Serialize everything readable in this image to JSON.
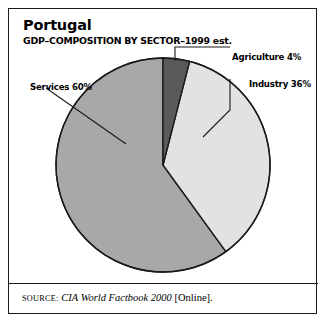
{
  "header": {
    "title": "Portugal",
    "subtitle": "GDP–COMPOSITION BY SECTOR–1999 est."
  },
  "labels": {
    "agriculture": "Agriculture 4%",
    "industry": "Industry 36%",
    "services": "Services 60%"
  },
  "source": {
    "kicker": "SOURCE:",
    "work": "CIA World Factbook 2000",
    "suffix": "[Online]."
  },
  "colors": {
    "agriculture": "#5a5a5a",
    "industry": "#e2e2e2",
    "services": "#a8a8a8",
    "outline": "#1a1a1a",
    "background": "#ffffff",
    "leader": "#1a1a1a"
  },
  "chart_data": {
    "type": "pie",
    "title": "Portugal",
    "subtitle": "GDP–COMPOSITION BY SECTOR–1999 est.",
    "xlabel": "",
    "ylabel": "",
    "unit": "%",
    "start_angle_deg": 0,
    "direction": "clockwise",
    "legend": "none",
    "grid": false,
    "categories": [
      "Agriculture",
      "Industry",
      "Services"
    ],
    "values": [
      4,
      36,
      60
    ],
    "slices": [
      {
        "name": "Agriculture",
        "value": 4,
        "label": "Agriculture 4%",
        "color": "#5a5a5a",
        "start_deg": 0,
        "end_deg": 14.4
      },
      {
        "name": "Industry",
        "value": 36,
        "label": "Industry 36%",
        "color": "#e2e2e2",
        "start_deg": 14.4,
        "end_deg": 144
      },
      {
        "name": "Services",
        "value": 60,
        "label": "Services 60%",
        "color": "#a8a8a8",
        "start_deg": 144,
        "end_deg": 360
      }
    ],
    "total": 100,
    "source": "SOURCE: CIA World Factbook 2000 [Online]."
  }
}
